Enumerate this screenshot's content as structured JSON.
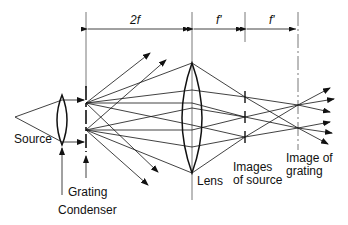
{
  "diagram": {
    "dimensions": [
      {
        "label": "2f",
        "from_x": 86,
        "to_x": 192
      },
      {
        "label": "f'",
        "from_x": 192,
        "to_x": 245
      },
      {
        "label": "f'",
        "from_x": 245,
        "to_x": 298
      }
    ],
    "labels": {
      "source": "Source",
      "grating": "Grating",
      "condenser": "Condenser",
      "lens": "Lens",
      "images_of_source_1": "Images",
      "images_of_source_2": "of source",
      "image_of_grating_1": "Image of",
      "image_of_grating_2": "grating"
    },
    "colors": {
      "line": "#111111",
      "background": "#ffffff",
      "guide": "#555555"
    }
  }
}
